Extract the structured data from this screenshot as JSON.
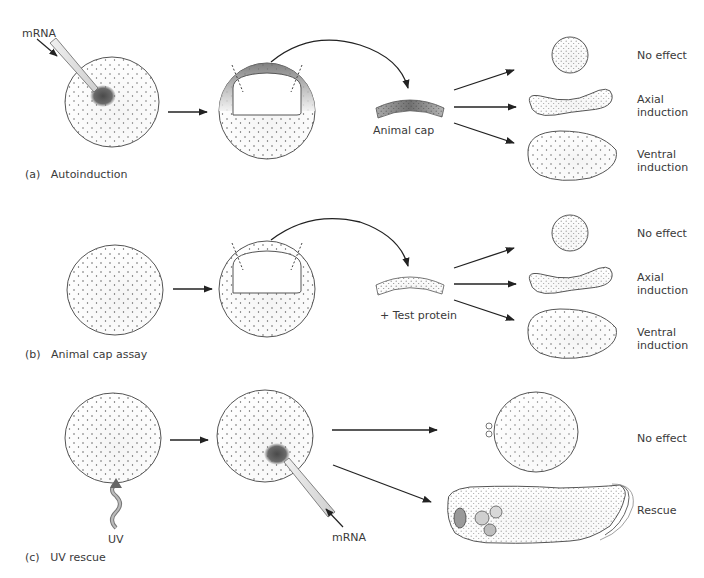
{
  "panels": [
    {
      "id": "a",
      "caption_letter": "(a)",
      "caption_text": "Autoinduction",
      "injection_label": "mRNA",
      "explant_label": "Animal cap",
      "outcomes": [
        {
          "label": "No effect",
          "line2": ""
        },
        {
          "label": "Axial",
          "line2": "induction"
        },
        {
          "label": "Ventral",
          "line2": "induction"
        }
      ]
    },
    {
      "id": "b",
      "caption_letter": "(b)",
      "caption_text": "Animal cap assay",
      "explant_label": "+ Test protein",
      "outcomes": [
        {
          "label": "No effect",
          "line2": ""
        },
        {
          "label": "Axial",
          "line2": "induction"
        },
        {
          "label": "Ventral",
          "line2": "induction"
        }
      ]
    },
    {
      "id": "c",
      "caption_letter": "(c)",
      "caption_text": "UV rescue",
      "irradiation_label": "UV",
      "injection_label": "mRNA",
      "outcomes": [
        {
          "label": "No effect",
          "line2": ""
        },
        {
          "label": "Rescue",
          "line2": ""
        }
      ]
    }
  ],
  "colors": {
    "stroke": "#555555",
    "dot": "#444444",
    "injection_blot": "#5a5a5a",
    "background": "#ffffff"
  }
}
